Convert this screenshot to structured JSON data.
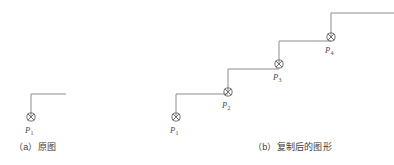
{
  "image": {
    "width": 394,
    "height": 165,
    "background": "#ffffff"
  },
  "style": {
    "line_color": "#8c8c8c",
    "marker_color": "#6f6f6f",
    "label_color": "#4a4a4a",
    "caption_color": "#3d3d3d",
    "line_width": 1
  },
  "figures": [
    {
      "id": "figure-a",
      "caption": "（a）原图",
      "caption_x": 14,
      "caption_y": 143,
      "marker_icon": "crossed-circle-icon",
      "elements": [
        {
          "name": "shape-1",
          "label": "P",
          "subscript": "1",
          "marker_x": 31,
          "marker_y": 117,
          "vertical_top_y": 94,
          "horizontal_end_x": 66,
          "label_x": 25,
          "label_y": 126
        }
      ]
    },
    {
      "id": "figure-b",
      "caption": "（b）复制后的图形",
      "caption_x": 253,
      "caption_y": 143,
      "marker_icon": "crossed-circle-icon",
      "elements": [
        {
          "name": "shape-1",
          "label": "P",
          "subscript": "1",
          "marker_x": 176,
          "marker_y": 117,
          "vertical_top_y": 94,
          "horizontal_end_x": 228,
          "label_x": 170,
          "label_y": 126
        },
        {
          "name": "shape-2",
          "label": "P",
          "subscript": "2",
          "marker_x": 228,
          "marker_y": 92,
          "vertical_top_y": 69,
          "horizontal_end_x": 279,
          "label_x": 222,
          "label_y": 101
        },
        {
          "name": "shape-3",
          "label": "P",
          "subscript": "3",
          "marker_x": 279,
          "marker_y": 64,
          "vertical_top_y": 41,
          "horizontal_end_x": 331,
          "label_x": 273,
          "label_y": 73
        },
        {
          "name": "shape-4",
          "label": "P",
          "subscript": "4",
          "marker_x": 331,
          "marker_y": 37,
          "vertical_top_y": 13,
          "horizontal_end_x": 394,
          "label_x": 325,
          "label_y": 46
        }
      ]
    }
  ]
}
